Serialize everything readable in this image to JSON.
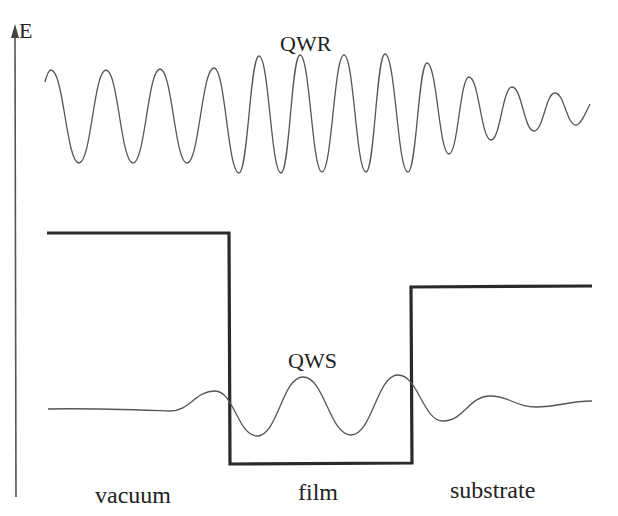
{
  "diagram": {
    "axis": {
      "label": "E",
      "direction": "up"
    },
    "waves": {
      "qwr": {
        "label": "QWR",
        "description": "quantum well resonance — oscillating wavefunction above the potential, amplitude grows over the film region and decays into substrate"
      },
      "qws": {
        "label": "QWS",
        "description": "quantum well state — bound wavefunction confined in film, evanescent tails into vacuum and substrate"
      }
    },
    "potential": {
      "description": "step potential: high in vacuum, lowest in film, intermediate in substrate",
      "regions": [
        {
          "name": "vacuum",
          "relative_level": "high"
        },
        {
          "name": "film",
          "relative_level": "low"
        },
        {
          "name": "substrate",
          "relative_level": "medium"
        }
      ]
    },
    "region_labels": [
      "vacuum",
      "film",
      "substrate"
    ],
    "colors": {
      "potential": "#2a2a2a",
      "wave": "#555555",
      "text": "#222222",
      "background": "#ffffff"
    }
  }
}
